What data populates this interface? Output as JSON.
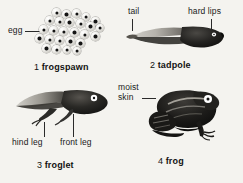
{
  "diagram": {
    "background_color": "#f4f3ef",
    "ink_color": "#1a1a1a",
    "egg_count": 26
  },
  "stages": [
    {
      "number": "1",
      "name": "frogspawn",
      "caption_number": "1",
      "caption_name": "frogspawn",
      "callouts": [
        {
          "text": "egg",
          "leader": "horizontal"
        }
      ]
    },
    {
      "number": "2",
      "name": "tadpole",
      "caption_number": "2",
      "caption_name": "tadpole",
      "callouts": [
        {
          "text": "tail",
          "leader": "vertical"
        },
        {
          "text": "hard lips",
          "leader": "vertical"
        }
      ]
    },
    {
      "number": "3",
      "name": "froglet",
      "caption_number": "3",
      "caption_name": "froglet",
      "callouts": [
        {
          "text": "hind leg",
          "leader": "vertical"
        },
        {
          "text": "front leg",
          "leader": "vertical"
        }
      ]
    },
    {
      "number": "4",
      "name": "frog",
      "caption_number": "4",
      "caption_name": "frog",
      "callouts": [
        {
          "text_line1": "moist",
          "text_line2": "skin",
          "leader": "horizontal"
        }
      ]
    }
  ]
}
